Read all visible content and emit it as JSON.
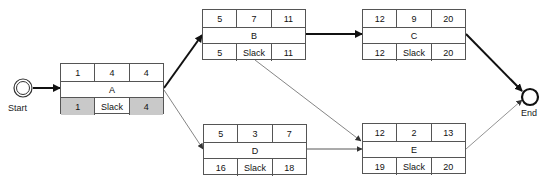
{
  "diagram": {
    "type": "activity-on-node network",
    "start_label": "Start",
    "end_label": "End",
    "nodes": [
      {
        "id": "A",
        "name": "A",
        "es": "1",
        "dur": "4",
        "ef": "4",
        "ls": "1",
        "slack": "Slack",
        "lf": "4",
        "highlight": true
      },
      {
        "id": "B",
        "name": "B",
        "es": "5",
        "dur": "7",
        "ef": "11",
        "ls": "5",
        "slack": "Slack",
        "lf": "11",
        "highlight": false
      },
      {
        "id": "C",
        "name": "C",
        "es": "12",
        "dur": "9",
        "ef": "20",
        "ls": "12",
        "slack": "Slack",
        "lf": "20",
        "highlight": false
      },
      {
        "id": "D",
        "name": "D",
        "es": "5",
        "dur": "3",
        "ef": "7",
        "ls": "16",
        "slack": "Slack",
        "lf": "18",
        "highlight": false
      },
      {
        "id": "E",
        "name": "E",
        "es": "12",
        "dur": "2",
        "ef": "13",
        "ls": "19",
        "slack": "Slack",
        "lf": "20",
        "highlight": false
      }
    ],
    "edges": [
      {
        "from": "Start",
        "to": "A",
        "critical": true
      },
      {
        "from": "A",
        "to": "B",
        "critical": true
      },
      {
        "from": "A",
        "to": "D",
        "critical": false
      },
      {
        "from": "B",
        "to": "C",
        "critical": true
      },
      {
        "from": "B",
        "to": "E",
        "critical": false
      },
      {
        "from": "D",
        "to": "E",
        "critical": false
      },
      {
        "from": "C",
        "to": "End",
        "critical": true
      },
      {
        "from": "E",
        "to": "End",
        "critical": false
      }
    ]
  }
}
